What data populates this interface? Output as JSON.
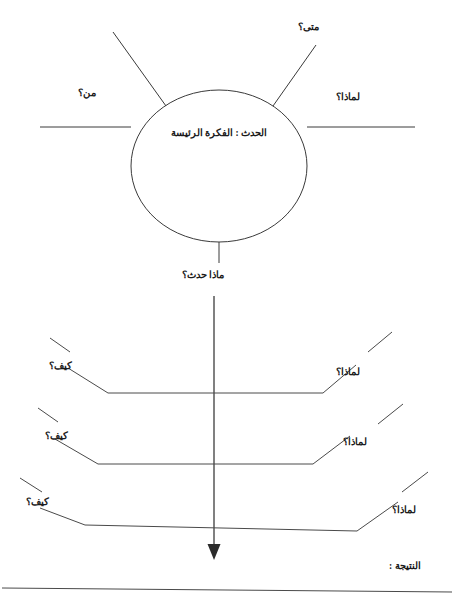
{
  "worksheet": {
    "title_center": "الحدث : الفكرة الرئيسة",
    "stem_label": "ماذا حدث؟",
    "result_label": "النتيجة :",
    "top_spoke_labels": [
      {
        "id": "when",
        "text": "متى؟"
      },
      {
        "id": "who",
        "text": "من؟"
      },
      {
        "id": "why-top",
        "text": "لماذا؟"
      }
    ],
    "left_labels": [
      {
        "id": "how-1",
        "text": "كيف؟"
      },
      {
        "id": "how-2",
        "text": "كيف؟"
      },
      {
        "id": "how-3",
        "text": "كيف؟"
      }
    ],
    "right_labels": [
      {
        "id": "why-1",
        "text": "لماذا؟"
      },
      {
        "id": "why-2",
        "text": "لماذا؟"
      },
      {
        "id": "why-3",
        "text": "لماذا؟"
      }
    ],
    "colors": {
      "ink": "#1b1b1b",
      "stroke": "#3a3a3a",
      "background": "#ffffff"
    }
  }
}
